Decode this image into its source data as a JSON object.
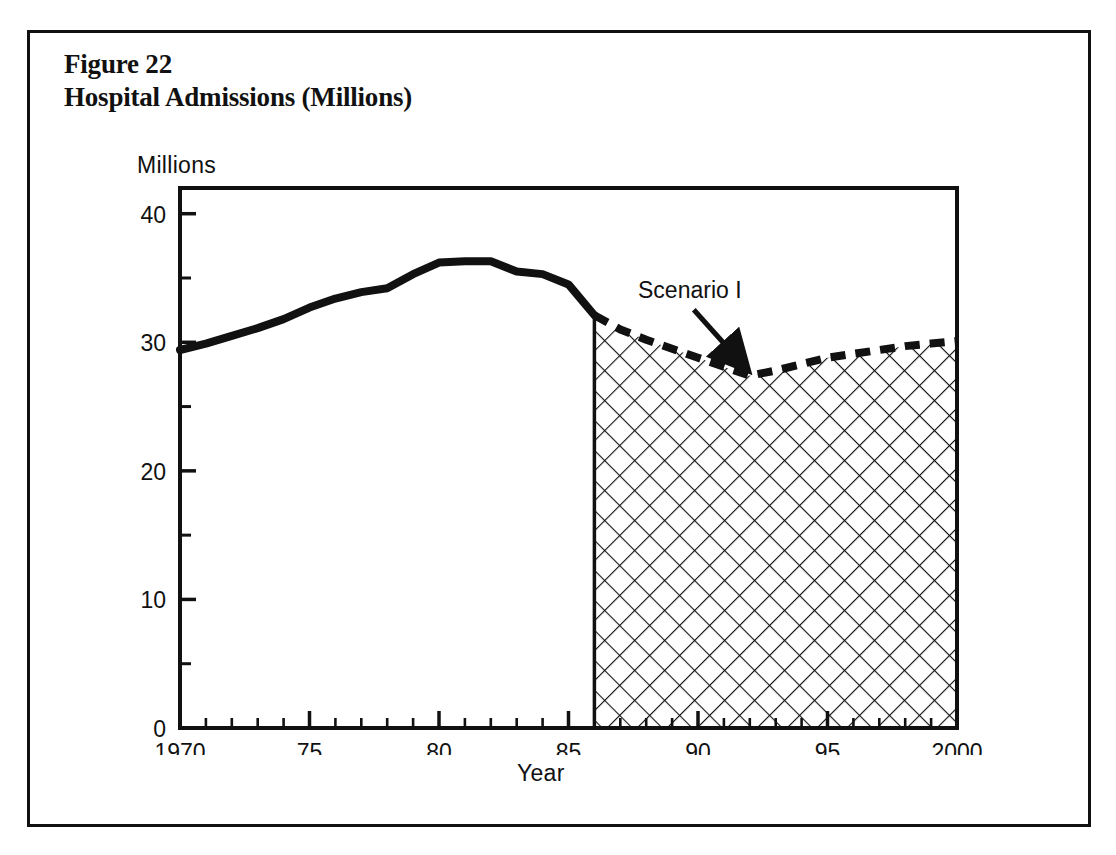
{
  "figure": {
    "number_label": "Figure 22",
    "title": "Hospital Admissions (Millions)"
  },
  "chart_data": {
    "type": "area",
    "title": "Hospital Admissions (Millions)",
    "xlabel": "Year",
    "ylabel": "Millions",
    "xlim": [
      1970,
      2000
    ],
    "ylim": [
      0,
      42
    ],
    "yticks": [
      0,
      10,
      20,
      30,
      40
    ],
    "ytick_labels": [
      "0",
      "10",
      "20",
      "30",
      "40"
    ],
    "yminor_ticks": [
      5,
      15,
      25,
      35
    ],
    "xticks": [
      1970,
      1975,
      1980,
      1985,
      1990,
      1995,
      2000
    ],
    "xtick_labels": [
      "1970",
      "75",
      "80",
      "85",
      "90",
      "95",
      "2000"
    ],
    "xminor_interval": 1,
    "grid": false,
    "legend": "none",
    "annotations": [
      {
        "text": "Scenario I",
        "points_to_x": 1992,
        "points_to_y": 27.4,
        "style": "arrow"
      }
    ],
    "series": [
      {
        "name": "Historical",
        "style": "solid-thick",
        "x": [
          1970,
          1971,
          1972,
          1973,
          1974,
          1975,
          1976,
          1977,
          1978,
          1979,
          1980,
          1981,
          1982,
          1983,
          1984,
          1985,
          1986
        ],
        "values": [
          29.4,
          29.9,
          30.5,
          31.1,
          31.8,
          32.7,
          33.4,
          33.9,
          34.2,
          35.3,
          36.2,
          36.3,
          36.3,
          35.5,
          35.3,
          34.5,
          32.1
        ]
      },
      {
        "name": "Scenario I",
        "style": "dashed-thick-hatched-area",
        "x": [
          1986,
          1987,
          1988,
          1989,
          1990,
          1991,
          1992,
          1993,
          1994,
          1995,
          1996,
          1997,
          1998,
          1999,
          2000
        ],
        "values": [
          32.1,
          31.0,
          30.2,
          29.5,
          28.8,
          28.1,
          27.4,
          27.8,
          28.3,
          28.8,
          29.1,
          29.4,
          29.7,
          29.9,
          30.1
        ]
      }
    ],
    "projection_start_year": 1986,
    "hatch_fill": "crosshatch-45deg",
    "line_color": "#111111"
  }
}
